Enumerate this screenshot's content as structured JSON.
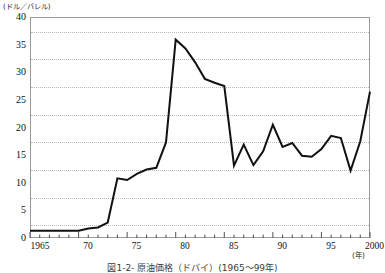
{
  "figure": {
    "caption": "図1-2- 原油価格（ドバイ）(1965～99年)"
  },
  "chart_data": {
    "type": "line",
    "title": "",
    "xlabel": "(年)",
    "ylabel": "(ドル／バレル)",
    "ylim": [
      0,
      40
    ],
    "xlim": [
      1965,
      2000
    ],
    "ytick_values": [
      0,
      5,
      10,
      15,
      20,
      25,
      30,
      35,
      40
    ],
    "ytick_labels": [
      "0",
      "5",
      "10",
      "15",
      "20",
      "25",
      "30",
      "35",
      "40"
    ],
    "xtick_values": [
      1965,
      1970,
      1975,
      1980,
      1985,
      1990,
      1995,
      2000
    ],
    "xtick_labels": [
      "1965",
      "70",
      "75",
      "80",
      "85",
      "90",
      "95",
      "2000"
    ],
    "xminor_step": 1,
    "grid": "horizontal-dotted",
    "legend": "none",
    "line_color": "#111111",
    "grid_color": "#b9b9b9",
    "frame_color": "#9a9a9a",
    "series": [
      {
        "name": "原油価格（ドバイ）",
        "x": [
          1965,
          1966,
          1967,
          1968,
          1969,
          1970,
          1971,
          1972,
          1973,
          1974,
          1975,
          1976,
          1977,
          1978,
          1979,
          1980,
          1981,
          1982,
          1983,
          1984,
          1985,
          1986,
          1987,
          1988,
          1989,
          1990,
          1991,
          1992,
          1993,
          1994,
          1995,
          1996,
          1997,
          1998,
          1999,
          2000
        ],
        "values": [
          1.3,
          1.3,
          1.3,
          1.3,
          1.3,
          1.3,
          1.7,
          1.9,
          2.8,
          10.8,
          10.5,
          11.6,
          12.4,
          12.7,
          17.3,
          35.9,
          34.3,
          31.8,
          28.8,
          28.1,
          27.5,
          13.1,
          16.9,
          13.2,
          15.7,
          20.5,
          16.5,
          17.2,
          14.9,
          14.7,
          16.1,
          18.5,
          18.1,
          12.2,
          17.5,
          26.5
        ]
      }
    ]
  }
}
